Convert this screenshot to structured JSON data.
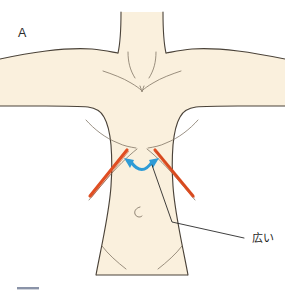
{
  "figure": {
    "panel_label": "A",
    "type": "anatomical-illustration",
    "background_color": "#ffffff"
  },
  "colors": {
    "skin_fill": "#faf0dd",
    "outline": "#4a4238",
    "inner_line": "#7a6e5e",
    "incision_red": "#e04e22",
    "incision_red_dark": "#c8401a",
    "arrow_blue": "#2e9bd6",
    "leader_line": "#1d1d1d",
    "footer_bar": "#8a93a8",
    "label_text": "#1d1d1d"
  },
  "annotations": {
    "callout": {
      "label": "広い",
      "meaning_hint": "wide",
      "label_x": 254,
      "label_y": 242,
      "leader_points": "152,165 172,222 244,238"
    },
    "incision_lines": [
      {
        "side": "left-costal-margin",
        "x1": 127,
        "y1": 150,
        "x2": 90,
        "y2": 196
      },
      {
        "side": "right-costal-margin",
        "x1": 155,
        "y1": 150,
        "x2": 193,
        "y2": 196
      }
    ],
    "double_arrow": {
      "name": "bidirectional-span-arrow",
      "path": "M 127,161 Q 141,176 156,161",
      "color": "#2e9bd6"
    }
  },
  "footer": {
    "bar_label": ""
  }
}
